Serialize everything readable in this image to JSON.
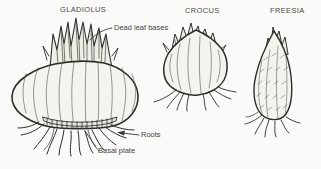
{
  "specimens": [
    {
      "name": "GLADIOLUS"
    },
    {
      "name": "CROCUS"
    },
    {
      "name": "FREESIA"
    }
  ],
  "annotations": {
    "dead_leaf_bases": "Dead leaf bases",
    "roots": "Roots",
    "basal_plate": "Basal plate"
  },
  "colors": {
    "ink": "#2e2d2a",
    "paper": "#fbfaf8",
    "corm_fill": "#f5f3ee",
    "tuft_fill": "#efede6",
    "label_text": "#3f3f3b"
  }
}
